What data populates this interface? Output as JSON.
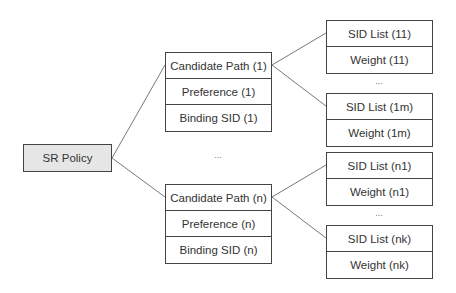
{
  "root": {
    "label": "SR Policy"
  },
  "candidate_paths": [
    {
      "name": "Candidate Path (1)",
      "preference": "Preference (1)",
      "binding_sid": "Binding SID (1)",
      "sid_lists": [
        {
          "sid": "SID List (11)",
          "weight": "Weight (11)"
        },
        {
          "sid": "SID List (1m)",
          "weight": "Weight (1m)"
        }
      ]
    },
    {
      "name": "Candidate Path (n)",
      "preference": "Preference (n)",
      "binding_sid": "Binding SID (n)",
      "sid_lists": [
        {
          "sid": "SID List (n1)",
          "weight": "Weight (n1)"
        },
        {
          "sid": "SID List (nk)",
          "weight": "Weight (nk)"
        }
      ]
    }
  ],
  "ellipsis": "..."
}
